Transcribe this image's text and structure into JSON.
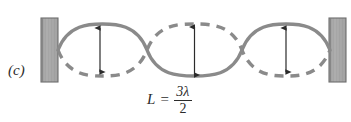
{
  "figure": {
    "panel_label": "(c)",
    "caption_formula": {
      "variable": "L",
      "equals": "=",
      "numerator": "3λ",
      "denominator": "2",
      "plain_text": "L = 3λ/2"
    },
    "colors": {
      "wave_stroke": "#8a8a8a",
      "wall_fill": "#a9a9a9",
      "wall_edge": "#6e6e6e",
      "arrow": "#2b2b2b",
      "text": "#2b2b2b",
      "background": "#ffffff"
    },
    "geometry": {
      "centerline_y": 50,
      "node_positions_x": [
        58,
        147,
        242,
        330
      ],
      "antinode_positions_x": [
        100,
        194,
        285
      ],
      "amplitude": 26,
      "wave_stroke_width": 3.4,
      "dash_pattern": "9 7"
    },
    "walls": [
      {
        "name": "left-wall",
        "x": 41,
        "y": 18,
        "width": 17,
        "height": 64
      },
      {
        "name": "right-wall",
        "x": 329,
        "y": 18,
        "width": 17,
        "height": 64
      }
    ],
    "amplitude_arrows": [
      {
        "name": "amplitude-arrow-1",
        "x": 100,
        "top_y": 27,
        "bottom_y": 73
      },
      {
        "name": "amplitude-arrow-2",
        "x": 194,
        "top_y": 26,
        "bottom_y": 76
      },
      {
        "name": "amplitude-arrow-3",
        "x": 285,
        "top_y": 27,
        "bottom_y": 73
      }
    ],
    "curves": [
      {
        "name": "solid-standing-wave",
        "style": "solid",
        "phase": "positive-first-lobe"
      },
      {
        "name": "dashed-standing-wave",
        "style": "dashed",
        "phase": "negative-first-lobe"
      }
    ]
  }
}
